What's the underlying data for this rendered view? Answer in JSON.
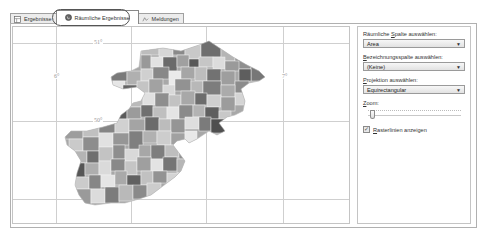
{
  "tabs": [
    {
      "label": "Ergebnisse",
      "icon": "table-icon",
      "active": false
    },
    {
      "label": "Räumliche Ergebnisse",
      "icon": "globe-icon",
      "active": true
    },
    {
      "label": "Meldungen",
      "icon": "message-icon",
      "active": false
    }
  ],
  "map": {
    "grid_labels": {
      "lat_top": "51°",
      "lat_mid": "50°",
      "lon_left": "6°",
      "lon_right": "7°"
    },
    "fill_colors": [
      "#6e6e6e",
      "#8a8a8a",
      "#a3a3a3",
      "#bcbcbc",
      "#d2d2d2",
      "#e6e6e6",
      "#575757",
      "#999999"
    ],
    "grid_color": "#cfcfcf"
  },
  "side_panel": {
    "spatial_column": {
      "label_pre": "Räumliche ",
      "label_accel": "S",
      "label_post": "palte auswählen:",
      "value": "Area"
    },
    "label_column": {
      "label_accel": "B",
      "label_post": "ezeichnungsspalte auswählen:",
      "value": "(Keine)"
    },
    "projection": {
      "label_accel": "P",
      "label_post": "rojektion auswählen:",
      "value": "Equirectangular"
    },
    "zoom": {
      "label_accel": "Z",
      "label_post": "oom:",
      "value_percent": 5
    },
    "gridlines": {
      "label_accel": "R",
      "label_post": "asterlinien anzeigen",
      "checked": true,
      "check_glyph": "✓"
    },
    "caret_glyph": "▼"
  }
}
